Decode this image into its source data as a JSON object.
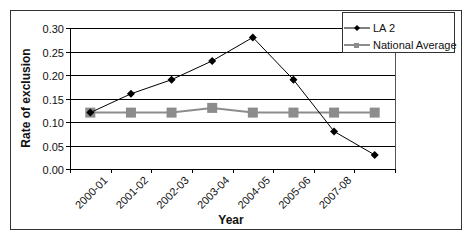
{
  "chart_data": {
    "type": "line",
    "title": "",
    "xlabel": "Year",
    "ylabel": "Rate of exclusion",
    "categories": [
      "2000-01",
      "2001-02",
      "2002-03",
      "2003-04",
      "2004-05",
      "2005-06",
      "2007-08",
      ""
    ],
    "yticks": [
      "0.00",
      "0.05",
      "0.10",
      "0.15",
      "0.20",
      "0.25",
      "0.30"
    ],
    "ylim": [
      0,
      0.3
    ],
    "grid": true,
    "legend_position": "top-right",
    "series": [
      {
        "name": "LA 2",
        "color": "#000000",
        "marker": "diamond",
        "values": [
          0.12,
          0.16,
          0.19,
          0.23,
          0.28,
          0.19,
          0.08,
          0.03
        ]
      },
      {
        "name": "National Average",
        "color": "#8c8c8c",
        "marker": "square",
        "values": [
          0.12,
          0.12,
          0.12,
          0.13,
          0.12,
          0.12,
          0.12,
          0.12
        ]
      }
    ]
  }
}
